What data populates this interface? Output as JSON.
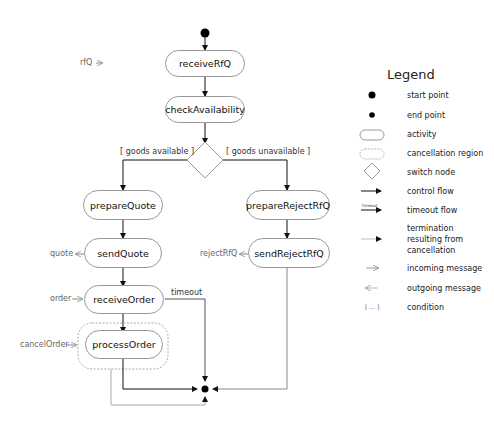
{
  "activities": {
    "receiveRfQ": "receiveRfQ",
    "checkAvailability": "checkAvailability",
    "prepareQuote": "prepareQuote",
    "sendQuote": "sendQuote",
    "receiveOrder": "receiveOrder",
    "processOrder": "processOrder",
    "prepareRejectRfQ": "prepareRejectRfQ",
    "sendRejectRfQ": "sendRejectRfQ"
  },
  "conditions": {
    "available": "[ goods available ]",
    "unavailable": "[ goods unavailable ]"
  },
  "messages": {
    "rfq": "rfQ",
    "quote": "quote",
    "order": "order",
    "cancelOrder": "cancelOrder",
    "rejectRfQ": "rejectRfQ"
  },
  "timeout_label": "timeout",
  "legend": {
    "title": "Legend",
    "items": [
      {
        "icon": "start-point-icon",
        "label": "start point"
      },
      {
        "icon": "end-point-icon",
        "label": "end point"
      },
      {
        "icon": "activity-icon",
        "label": "activity"
      },
      {
        "icon": "cancellation-region-icon",
        "label": "cancellation region"
      },
      {
        "icon": "switch-node-icon",
        "label": "switch node"
      },
      {
        "icon": "control-flow-icon",
        "label": "control flow"
      },
      {
        "icon": "timeout-flow-icon",
        "label": "timeout flow",
        "icon_text": "timeout"
      },
      {
        "icon": "termination-flow-icon",
        "label": "termination resulting from cancellation"
      },
      {
        "icon": "incoming-message-icon",
        "label": "incoming message"
      },
      {
        "icon": "outgoing-message-icon",
        "label": "outgoing message"
      },
      {
        "icon": "condition-icon",
        "label": "condition",
        "icon_text": "[ ... ]"
      }
    ]
  }
}
